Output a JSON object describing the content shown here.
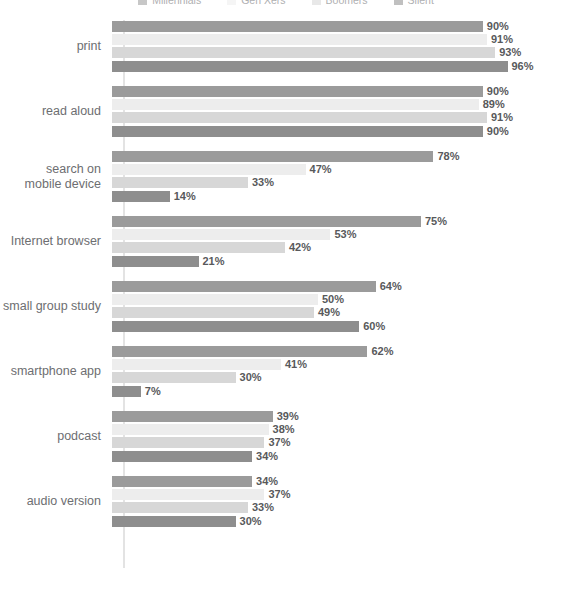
{
  "chart_data": {
    "type": "bar",
    "orientation": "horizontal",
    "title": "",
    "subtitle": "",
    "xlabel": "",
    "ylabel": "",
    "xlim": [
      0,
      100
    ],
    "grid": false,
    "value_suffix": "%",
    "legend_position": "top",
    "axis_max": 100,
    "px_per_unit": 4.12,
    "categories": [
      "print",
      "read aloud",
      "search on\nmobile device",
      "Internet browser",
      "small group study",
      "smartphone app",
      "podcast",
      "audio version"
    ],
    "series": [
      {
        "name": "Millennials",
        "color": "#9b9b9b",
        "values": [
          90,
          90,
          78,
          75,
          64,
          62,
          39,
          34
        ],
        "labels": [
          "90%",
          "90%",
          "78%",
          "75%",
          "64%",
          "62%",
          "39%",
          "34%"
        ]
      },
      {
        "name": "Gen Xers",
        "color": "#ededed",
        "values": [
          91,
          89,
          47,
          53,
          50,
          41,
          38,
          37
        ],
        "labels": [
          "91%",
          "89%",
          "47%",
          "53%",
          "50%",
          "41%",
          "38%",
          "37%"
        ]
      },
      {
        "name": "Boomers",
        "color": "#d7d7d7",
        "values": [
          93,
          91,
          33,
          42,
          49,
          30,
          37,
          33
        ],
        "labels": [
          "93%",
          "91%",
          "33%",
          "42%",
          "49%",
          "30%",
          "37%",
          "33%"
        ]
      },
      {
        "name": "Silent",
        "color": "#8e8e8e",
        "values": [
          96,
          90,
          14,
          21,
          60,
          7,
          34,
          30
        ],
        "labels": [
          "96%",
          "90%",
          "14%",
          "21%",
          "60%",
          "7%",
          "34%",
          "30%"
        ]
      }
    ]
  }
}
